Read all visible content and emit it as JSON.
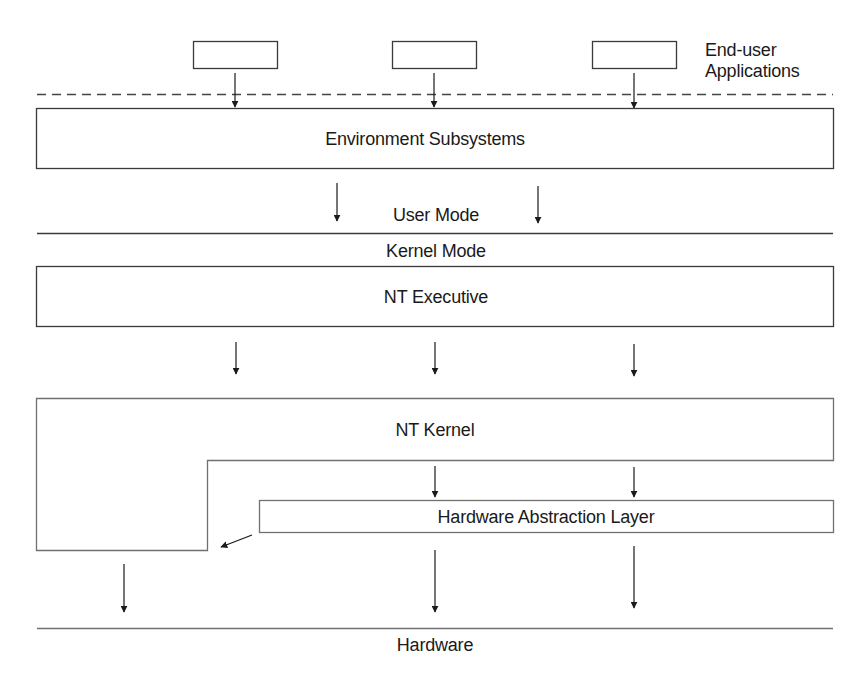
{
  "diagram": {
    "type": "layered-architecture",
    "colors": {
      "line": "#3a3a3a",
      "text": "#1a1a1a",
      "background": "#ffffff"
    },
    "end_user": {
      "label_line1": "End-user",
      "label_line2": "Applications",
      "app_boxes": 3
    },
    "layers": {
      "environment_subsystems": "Environment Subsystems",
      "user_mode": "User Mode",
      "kernel_mode": "Kernel Mode",
      "nt_executive": "NT Executive",
      "nt_kernel": "NT Kernel",
      "hal": "Hardware Abstraction Layer",
      "hardware": "Hardware"
    }
  }
}
